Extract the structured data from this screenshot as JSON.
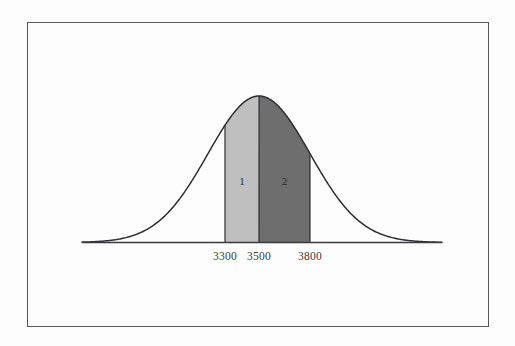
{
  "figure": {
    "background_color": "#fdfdfd",
    "frame_color": "#55555c",
    "curve_color": "#2e2e33",
    "axis_color": "#3a3a40"
  },
  "chart_data": {
    "type": "area",
    "title": "",
    "subtitle": "",
    "xlabel": "",
    "ylabel": "",
    "grid": false,
    "legend_position": "none",
    "distribution": "normal",
    "mean": 3500,
    "std_dev": 300,
    "xlim": [
      2150,
      4850
    ],
    "ylim": [
      0,
      1.05
    ],
    "axis_tick_labels": [
      "3300",
      "3500",
      "3800"
    ],
    "axis_tick_values": [
      3300,
      3500,
      3800
    ],
    "curve": {
      "name": "normal-density-curve",
      "peak_x": 3500,
      "peak_y": 1.0
    },
    "shaded_regions": [
      {
        "label": "1",
        "from": 3300,
        "to": 3500,
        "color": "#bfbfbf",
        "label_x": 3400,
        "label_y": 0.42
      },
      {
        "label": "2",
        "from": 3500,
        "to": 3800,
        "color": "#6e6e6e",
        "label_x": 3650,
        "label_y": 0.42
      }
    ],
    "annotations": [
      {
        "text": "1",
        "x": 3400,
        "y": 0.42
      },
      {
        "text": "2",
        "x": 3650,
        "y": 0.42
      }
    ]
  }
}
